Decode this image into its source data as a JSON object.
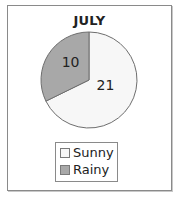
{
  "chart_data": {
    "type": "pie",
    "title": "JULY",
    "categories": [
      "Sunny",
      "Rainy"
    ],
    "values": [
      21,
      10
    ],
    "colors": [
      "#f7f7f7",
      "#a8a8a8"
    ],
    "slice_labels": [
      "21",
      "10"
    ],
    "legend": {
      "position": "bottom",
      "entries": [
        {
          "label": "Sunny",
          "color": "#f7f7f7"
        },
        {
          "label": "Rainy",
          "color": "#a8a8a8"
        }
      ]
    }
  }
}
